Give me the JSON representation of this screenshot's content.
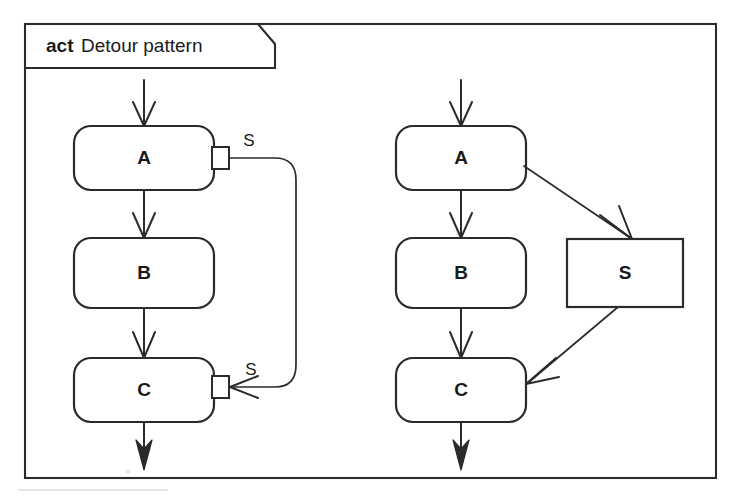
{
  "frame": {
    "kind_keyword": "act",
    "title": "Detour pattern",
    "notch_present": true
  },
  "diagram": {
    "type": "uml-activity-diagram",
    "variants": [
      {
        "name": "pin-notation",
        "side": "left",
        "nodes": [
          {
            "id": "left-a",
            "label": "A",
            "shape": "rounded-rectangle"
          },
          {
            "id": "left-b",
            "label": "B",
            "shape": "rounded-rectangle"
          },
          {
            "id": "left-c",
            "label": "C",
            "shape": "rounded-rectangle"
          }
        ],
        "pins": [
          {
            "id": "left-a-out-pin",
            "label": "S",
            "owner": "left-a",
            "direction": "output",
            "side": "right"
          },
          {
            "id": "left-c-in-pin",
            "label": "S",
            "owner": "left-c",
            "direction": "input",
            "side": "right"
          }
        ],
        "edges": [
          {
            "from": "start",
            "to": "left-a",
            "kind": "control-flow"
          },
          {
            "from": "left-a",
            "to": "left-b",
            "kind": "control-flow"
          },
          {
            "from": "left-b",
            "to": "left-c",
            "kind": "control-flow"
          },
          {
            "from": "left-c",
            "to": "end",
            "kind": "control-flow"
          },
          {
            "from": "left-a-out-pin",
            "to": "left-c-in-pin",
            "kind": "object-flow-detour"
          }
        ]
      },
      {
        "name": "object-node-notation",
        "side": "right",
        "nodes": [
          {
            "id": "right-a",
            "label": "A",
            "shape": "rounded-rectangle"
          },
          {
            "id": "right-b",
            "label": "B",
            "shape": "rounded-rectangle"
          },
          {
            "id": "right-c",
            "label": "C",
            "shape": "rounded-rectangle"
          },
          {
            "id": "right-s",
            "label": "S",
            "shape": "rectangle"
          }
        ],
        "pins": [],
        "edges": [
          {
            "from": "start",
            "to": "right-a",
            "kind": "control-flow"
          },
          {
            "from": "right-a",
            "to": "right-b",
            "kind": "control-flow"
          },
          {
            "from": "right-b",
            "to": "right-c",
            "kind": "control-flow"
          },
          {
            "from": "right-c",
            "to": "end",
            "kind": "control-flow"
          },
          {
            "from": "right-a",
            "to": "right-s",
            "kind": "object-flow"
          },
          {
            "from": "right-s",
            "to": "right-c",
            "kind": "object-flow"
          }
        ]
      }
    ]
  },
  "colors": {
    "ink": "#2b2b2b",
    "text": "#1a1a1a",
    "paper": "#ffffff"
  }
}
